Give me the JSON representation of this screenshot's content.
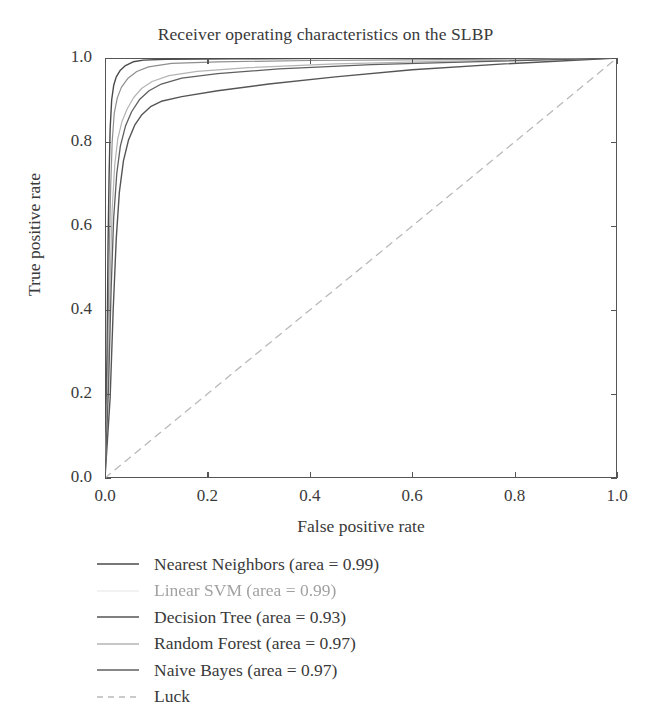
{
  "chart_data": {
    "type": "line",
    "title": "Receiver operating characteristics on the SLBP",
    "xlabel": "False positive rate",
    "ylabel": "True positive rate",
    "xlim": [
      0.0,
      1.0
    ],
    "ylim": [
      0.0,
      1.0
    ],
    "xticks": [
      "0.0",
      "0.2",
      "0.4",
      "0.6",
      "0.8",
      "1.0"
    ],
    "yticks": [
      "0.0",
      "0.2",
      "0.4",
      "0.6",
      "0.8",
      "1.0"
    ],
    "xtick_values": [
      0.0,
      0.2,
      0.4,
      0.6,
      0.8,
      1.0
    ],
    "ytick_values": [
      0.0,
      0.2,
      0.4,
      0.6,
      0.8,
      1.0
    ],
    "grid": false,
    "legend_position": "below-axes-left",
    "series": [
      {
        "name": "Nearest Neighbors",
        "area": "0.99",
        "legend_label": "Nearest Neighbors (area = 0.99)",
        "color": "#4a4a4a",
        "linestyle": "solid",
        "linewidth": 1.4,
        "faded": false,
        "points": [
          [
            0.0,
            0.0
          ],
          [
            0.004,
            0.3
          ],
          [
            0.006,
            0.56
          ],
          [
            0.008,
            0.72
          ],
          [
            0.01,
            0.83
          ],
          [
            0.013,
            0.9
          ],
          [
            0.017,
            0.935
          ],
          [
            0.022,
            0.955
          ],
          [
            0.03,
            0.971
          ],
          [
            0.04,
            0.982
          ],
          [
            0.055,
            0.991
          ],
          [
            0.075,
            0.995
          ],
          [
            0.12,
            0.997
          ],
          [
            0.25,
            0.998
          ],
          [
            0.45,
            0.999
          ],
          [
            0.7,
            0.999
          ],
          [
            1.0,
            1.0
          ]
        ]
      },
      {
        "name": "Linear SVM",
        "area": "0.99",
        "legend_label": "Linear SVM (area = 0.99)",
        "color": "#6e6e6e",
        "linestyle": "solid",
        "linewidth": 1.2,
        "faded": true,
        "points": [
          [
            0.0,
            0.0
          ],
          [
            0.005,
            0.27
          ],
          [
            0.008,
            0.52
          ],
          [
            0.011,
            0.69
          ],
          [
            0.014,
            0.8
          ],
          [
            0.018,
            0.868
          ],
          [
            0.024,
            0.905
          ],
          [
            0.032,
            0.93
          ],
          [
            0.045,
            0.952
          ],
          [
            0.062,
            0.968
          ],
          [
            0.085,
            0.979
          ],
          [
            0.13,
            0.987
          ],
          [
            0.22,
            0.991
          ],
          [
            0.4,
            0.994
          ],
          [
            0.65,
            0.996
          ],
          [
            1.0,
            1.0
          ]
        ]
      },
      {
        "name": "Decision Tree",
        "area": "0.93",
        "legend_label": "Decision Tree (area = 0.93)",
        "color": "#555555",
        "linestyle": "solid",
        "linewidth": 1.4,
        "faded": false,
        "points": [
          [
            0.0,
            0.0
          ],
          [
            0.01,
            0.19
          ],
          [
            0.016,
            0.4
          ],
          [
            0.022,
            0.57
          ],
          [
            0.028,
            0.68
          ],
          [
            0.036,
            0.755
          ],
          [
            0.046,
            0.805
          ],
          [
            0.058,
            0.84
          ],
          [
            0.072,
            0.865
          ],
          [
            0.09,
            0.885
          ],
          [
            0.11,
            0.897
          ],
          [
            0.15,
            0.908
          ],
          [
            0.22,
            0.922
          ],
          [
            0.32,
            0.938
          ],
          [
            0.45,
            0.955
          ],
          [
            0.6,
            0.972
          ],
          [
            0.78,
            0.986
          ],
          [
            1.0,
            1.0
          ]
        ]
      },
      {
        "name": "Random Forest",
        "area": "0.97",
        "legend_label": "Random Forest (area = 0.97)",
        "color": "#b4b4b4",
        "linestyle": "solid",
        "linewidth": 1.2,
        "faded": false,
        "points": [
          [
            0.0,
            0.0
          ],
          [
            0.006,
            0.24
          ],
          [
            0.01,
            0.47
          ],
          [
            0.014,
            0.64
          ],
          [
            0.019,
            0.745
          ],
          [
            0.025,
            0.808
          ],
          [
            0.033,
            0.848
          ],
          [
            0.043,
            0.878
          ],
          [
            0.056,
            0.906
          ],
          [
            0.072,
            0.928
          ],
          [
            0.092,
            0.944
          ],
          [
            0.125,
            0.958
          ],
          [
            0.18,
            0.968
          ],
          [
            0.28,
            0.977
          ],
          [
            0.45,
            0.986
          ],
          [
            0.7,
            0.993
          ],
          [
            1.0,
            1.0
          ]
        ]
      },
      {
        "name": "Naive Bayes",
        "area": "0.97",
        "legend_label": "Naive Bayes (area = 0.97)",
        "color": "#5f5f5f",
        "linestyle": "solid",
        "linewidth": 1.3,
        "faded": false,
        "points": [
          [
            0.0,
            0.0
          ],
          [
            0.007,
            0.22
          ],
          [
            0.012,
            0.45
          ],
          [
            0.017,
            0.62
          ],
          [
            0.023,
            0.725
          ],
          [
            0.03,
            0.79
          ],
          [
            0.04,
            0.838
          ],
          [
            0.052,
            0.872
          ],
          [
            0.068,
            0.902
          ],
          [
            0.086,
            0.922
          ],
          [
            0.11,
            0.938
          ],
          [
            0.15,
            0.952
          ],
          [
            0.22,
            0.963
          ],
          [
            0.34,
            0.974
          ],
          [
            0.52,
            0.984
          ],
          [
            0.75,
            0.992
          ],
          [
            1.0,
            1.0
          ]
        ]
      },
      {
        "name": "Luck",
        "area": null,
        "legend_label": "Luck",
        "color": "#b9b9b9",
        "linestyle": "dashed",
        "linewidth": 1.3,
        "faded": false,
        "points": [
          [
            0.0,
            0.0
          ],
          [
            1.0,
            1.0
          ]
        ]
      }
    ]
  }
}
